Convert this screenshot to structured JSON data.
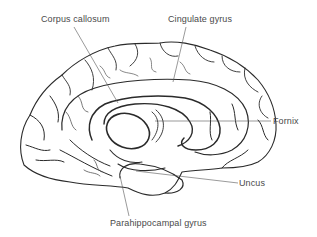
{
  "diagram": {
    "labels": {
      "corpus_callosum": "Corpus callosum",
      "cingulate_gyrus": "Cingulate gyrus",
      "fornix": "Fornix",
      "uncus": "Uncus",
      "parahippocampal_gyrus": "Parahippocampal gyrus"
    },
    "colors": {
      "outline": "#2a2a2a",
      "leader_line": "#555555",
      "label_text": "#4a4a4a",
      "background": "#ffffff"
    }
  }
}
